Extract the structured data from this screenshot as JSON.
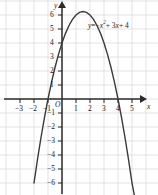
{
  "figure": {
    "background_color": "#ffffff",
    "grid_color": "#d9d9d9",
    "axis_color": "#2b2b2b",
    "curve_color": "#3a3a3a",
    "text_color": "#1a1a1a",
    "origin_label": "O",
    "x_axis_name": "x",
    "y_axis_name": "y"
  },
  "equation": {
    "lhs": "y",
    "eq": "=",
    "term1_sign": "−",
    "term1_base": "x",
    "term1_exp": "2",
    "term2": "+ 3",
    "term2_var": "x",
    "term3": "+ 4",
    "full_text": "y = −x² + 3x + 4"
  },
  "axes": {
    "x_ticks": [
      {
        "value": -3,
        "label": "−3"
      },
      {
        "value": -2,
        "label": "−2"
      },
      {
        "value": -1,
        "label": "−1"
      },
      {
        "value": 1,
        "label": "1"
      },
      {
        "value": 2,
        "label": "2"
      },
      {
        "value": 3,
        "label": "3"
      },
      {
        "value": 4,
        "label": "4"
      },
      {
        "value": 5,
        "label": "5"
      }
    ],
    "y_ticks": [
      {
        "value": 6,
        "label": "6"
      },
      {
        "value": 5,
        "label": "5"
      },
      {
        "value": 4,
        "label": "4"
      },
      {
        "value": 3,
        "label": "3"
      },
      {
        "value": 2,
        "label": "2"
      },
      {
        "value": 1,
        "label": "1"
      },
      {
        "value": -1,
        "label": "−1"
      },
      {
        "value": -2,
        "label": "−2"
      },
      {
        "value": -3,
        "label": "−3"
      },
      {
        "value": -4,
        "label": "−4"
      },
      {
        "value": -5,
        "label": "−5"
      },
      {
        "value": -6,
        "label": "−6"
      }
    ]
  },
  "chart_data": {
    "type": "line",
    "title": "",
    "subtitle": "",
    "xlabel": "x",
    "ylabel": "y",
    "xlim": [
      -3.9,
      5.5
    ],
    "ylim": [
      -7.0,
      7.0
    ],
    "grid": true,
    "legend": "none",
    "annotations": [
      {
        "text": "y = −x² + 3x + 4",
        "x": 2.0,
        "y": 5.3
      }
    ],
    "series": [
      {
        "name": "y = -x^2 + 3x + 4",
        "equation": "y = -x^2 + 3x + 4",
        "coefficients": {
          "a": -1,
          "b": 3,
          "c": 4
        },
        "vertex": [
          1.5,
          6.25
        ],
        "roots": [
          -1,
          4
        ],
        "y_intercept": 4,
        "color": "#3a3a3a",
        "x": [
          -2.0,
          -1.75,
          -1.5,
          -1.25,
          -1.0,
          -0.75,
          -0.5,
          -0.25,
          0.0,
          0.25,
          0.5,
          0.75,
          1.0,
          1.25,
          1.5,
          1.75,
          2.0,
          2.25,
          2.5,
          2.75,
          3.0,
          3.25,
          3.5,
          3.75,
          4.0,
          4.25,
          4.5,
          4.75,
          5.0,
          5.2
        ],
        "values": [
          -6.0,
          -4.31,
          -2.75,
          -1.31,
          0.0,
          1.19,
          2.25,
          3.19,
          4.0,
          4.69,
          5.25,
          5.69,
          6.0,
          6.19,
          6.25,
          6.19,
          6.0,
          5.69,
          5.25,
          4.69,
          4.0,
          3.19,
          2.25,
          1.19,
          0.0,
          -1.31,
          -2.75,
          -4.31,
          -6.0,
          -7.04
        ]
      }
    ]
  }
}
